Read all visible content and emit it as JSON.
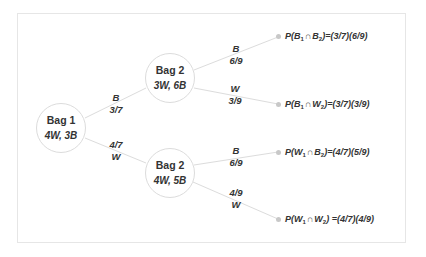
{
  "colors": {
    "edge": "#dcdcdc",
    "node_border": "#dcdcdc",
    "dot": "#c8c8c8",
    "text": "#333333",
    "frame": "#e6e6e6"
  },
  "nodes": {
    "root": {
      "title": "Bag 1",
      "contents": "4W, 3B"
    },
    "upper": {
      "title": "Bag 2",
      "contents": "3W, 6B"
    },
    "lower": {
      "title": "Bag 2",
      "contents": "4W, 5B"
    }
  },
  "edges": {
    "root_to_upper": {
      "event": "B",
      "prob": "3/7"
    },
    "root_to_lower": {
      "event": "W",
      "prob": "4/7"
    },
    "upper_to_o1": {
      "event": "B",
      "prob": "6/9"
    },
    "upper_to_o2": {
      "event": "W",
      "prob": "3/9"
    },
    "lower_to_o3": {
      "event": "B",
      "prob": "6/9"
    },
    "lower_to_o4": {
      "event": "W",
      "prob": "4/9"
    }
  },
  "outcomes": [
    {
      "p": "P(",
      "e1": "B",
      "s1": "1",
      "cap": "∩",
      "e2": "B",
      "s2": "2",
      "rhs": ")=(3/7)(6/9)"
    },
    {
      "p": "P(",
      "e1": "B",
      "s1": "1",
      "cap": "∩",
      "e2": "W",
      "s2": "2",
      "rhs": ")=(3/7)(3/9)"
    },
    {
      "p": "P(",
      "e1": "W",
      "s1": "1",
      "cap": "∩",
      "e2": "B",
      "s2": "2",
      "rhs": ")=(4/7)(5/9)"
    },
    {
      "p": "P(",
      "e1": "W",
      "s1": "1",
      "cap": "∩",
      "e2": "W",
      "s2": "2",
      "rhs": ") =(4/7)(4/9)"
    }
  ]
}
